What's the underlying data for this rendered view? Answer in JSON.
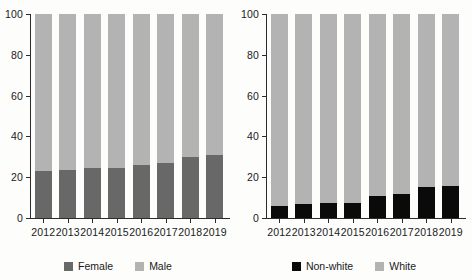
{
  "chart_data": [
    {
      "type": "bar",
      "subtype": "stacked-percentage",
      "panel": "left",
      "title": "",
      "xlabel": "",
      "ylabel": "",
      "ylim": [
        0,
        100
      ],
      "yticks": [
        0,
        20,
        40,
        60,
        80,
        100
      ],
      "grid": false,
      "legend_position": "bottom-center",
      "categories": [
        "2012",
        "2013",
        "2014",
        "2015",
        "2016",
        "2017",
        "2018",
        "2019"
      ],
      "series": [
        {
          "name": "Female",
          "color": "#686868",
          "values": [
            23,
            23.5,
            24.5,
            24.5,
            26,
            27,
            30,
            31
          ]
        },
        {
          "name": "Male",
          "color": "#b3b3b3",
          "values": [
            77,
            76.5,
            75.5,
            75.5,
            74,
            73,
            70,
            69
          ]
        }
      ]
    },
    {
      "type": "bar",
      "subtype": "stacked-percentage",
      "panel": "right",
      "title": "",
      "xlabel": "",
      "ylabel": "",
      "ylim": [
        0,
        100
      ],
      "yticks": [
        0,
        20,
        40,
        60,
        80,
        100
      ],
      "grid": false,
      "legend_position": "bottom-center",
      "categories": [
        "2012",
        "2013",
        "2014",
        "2015",
        "2016",
        "2017",
        "2018",
        "2019"
      ],
      "series": [
        {
          "name": "Non-white",
          "color": "#0a0a0a",
          "values": [
            6,
            7,
            7.5,
            7.5,
            11,
            12,
            15,
            15.5
          ]
        },
        {
          "name": "White",
          "color": "#b3b3b3",
          "values": [
            94,
            93,
            92.5,
            92.5,
            89,
            88,
            85,
            84.5
          ]
        }
      ]
    }
  ]
}
